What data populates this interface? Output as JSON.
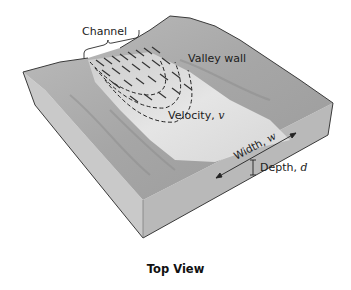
{
  "figure": {
    "caption": "Top View",
    "labels": {
      "channel": "Channel",
      "valley_wall": "Valley wall",
      "velocity": "Velocity,",
      "velocity_var": "v",
      "width": "Width,",
      "width_var": "w",
      "depth": "Depth,",
      "depth_var": "d"
    },
    "colors": {
      "block_top": "#a9a9a9",
      "block_side": "#c4c4c4",
      "water": "#e6e6e6",
      "outline": "#3a3a3a",
      "text": "#1c1c1c"
    }
  }
}
